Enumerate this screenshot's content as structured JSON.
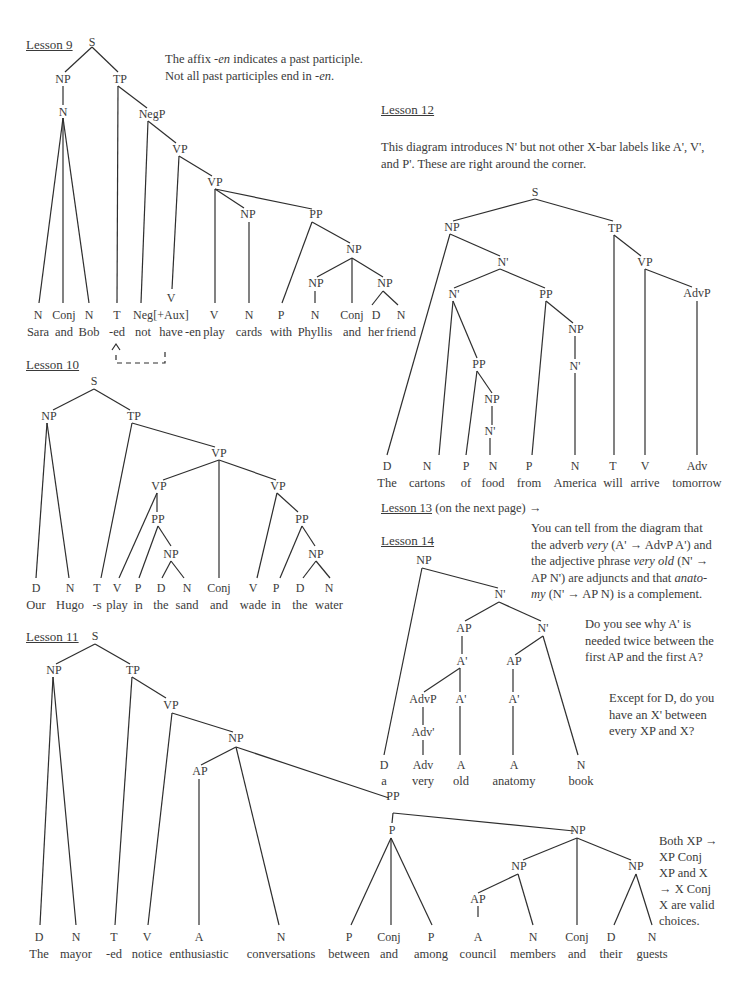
{
  "lesson9": {
    "title": "Lesson 9",
    "note_line1_pre": "The affix ",
    "note_line1_em": "-en",
    "note_line1_post": " indicates a past participle.",
    "note_line2_pre": "Not all past participles end in ",
    "note_line2_em": "-en",
    "note_line2_post": ".",
    "nodes": [
      {
        "id": "S",
        "label": "S",
        "x": 92,
        "y": 46
      },
      {
        "id": "NP1",
        "label": "NP",
        "x": 63,
        "y": 83
      },
      {
        "id": "TP",
        "label": "TP",
        "x": 120,
        "y": 83
      },
      {
        "id": "N1",
        "label": "N",
        "x": 63,
        "y": 116
      },
      {
        "id": "NegP",
        "label": "NegP",
        "x": 152,
        "y": 118
      },
      {
        "id": "VP1",
        "label": "VP",
        "x": 180,
        "y": 153
      },
      {
        "id": "VP2",
        "label": "VP",
        "x": 215,
        "y": 186
      },
      {
        "id": "NP2",
        "label": "NP",
        "x": 248,
        "y": 218
      },
      {
        "id": "PP",
        "label": "PP",
        "x": 316,
        "y": 218
      },
      {
        "id": "NP3",
        "label": "NP",
        "x": 354,
        "y": 253
      },
      {
        "id": "NP4",
        "label": "NP",
        "x": 316,
        "y": 287
      },
      {
        "id": "NP5",
        "label": "NP",
        "x": 385,
        "y": 287
      },
      {
        "id": "Vaux",
        "label": "V",
        "x": 171,
        "y": 302
      }
    ],
    "leaves": [
      {
        "pos": "N",
        "word": "Sara",
        "x": 38
      },
      {
        "pos": "Conj",
        "word": "and",
        "x": 64
      },
      {
        "pos": "N",
        "word": "Bob",
        "x": 89
      },
      {
        "pos": "T",
        "word": "-ed",
        "x": 117
      },
      {
        "pos": "Neg",
        "word": "not",
        "x": 143
      },
      {
        "pos": "[+Aux]",
        "word": "have",
        "x": 171
      },
      {
        "pos": "",
        "word": "-en",
        "x": 193
      },
      {
        "pos": "V",
        "word": "play",
        "x": 214
      },
      {
        "pos": "N",
        "word": "cards",
        "x": 249
      },
      {
        "pos": "P",
        "word": "with",
        "x": 281
      },
      {
        "pos": "N",
        "word": "Phyllis",
        "x": 315
      },
      {
        "pos": "Conj",
        "word": "and",
        "x": 352
      },
      {
        "pos": "D",
        "word": "her",
        "x": 376
      },
      {
        "pos": "N",
        "word": "friend",
        "x": 401
      }
    ]
  },
  "lesson10": {
    "title": "Lesson 10",
    "nodes": [
      {
        "label": "S",
        "x": 94,
        "y": 385
      },
      {
        "label": "NP",
        "x": 49,
        "y": 420
      },
      {
        "label": "TP",
        "x": 134,
        "y": 420
      },
      {
        "label": "VP",
        "x": 219,
        "y": 457
      },
      {
        "label": "VP",
        "x": 159,
        "y": 490
      },
      {
        "label": "VP",
        "x": 278,
        "y": 490
      },
      {
        "label": "PP",
        "x": 158,
        "y": 523
      },
      {
        "label": "PP",
        "x": 302,
        "y": 523
      },
      {
        "label": "NP",
        "x": 171,
        "y": 558
      },
      {
        "label": "NP",
        "x": 316,
        "y": 558
      }
    ],
    "leaves": [
      {
        "pos": "D",
        "word": "Our",
        "x": 36
      },
      {
        "pos": "N",
        "word": "Hugo",
        "x": 70
      },
      {
        "pos": "T",
        "word": "-s",
        "x": 97
      },
      {
        "pos": "V",
        "word": "play",
        "x": 117
      },
      {
        "pos": "P",
        "word": "in",
        "x": 138
      },
      {
        "pos": "D",
        "word": "the",
        "x": 161
      },
      {
        "pos": "N",
        "word": "sand",
        "x": 187
      },
      {
        "pos": "Conj",
        "word": "and",
        "x": 219
      },
      {
        "pos": "V",
        "word": "wade",
        "x": 253
      },
      {
        "pos": "P",
        "word": "in",
        "x": 276
      },
      {
        "pos": "D",
        "word": "the",
        "x": 300
      },
      {
        "pos": "N",
        "word": "water",
        "x": 329
      }
    ]
  },
  "lesson11": {
    "title": "Lesson 11",
    "note": [
      "Both XP →",
      "XP Conj",
      "XP and X",
      "→ X Conj",
      "X are valid",
      "choices."
    ],
    "nodes": [
      {
        "label": "S",
        "x": 95,
        "y": 640
      },
      {
        "label": "NP",
        "x": 54,
        "y": 674
      },
      {
        "label": "TP",
        "x": 133,
        "y": 674
      },
      {
        "label": "VP",
        "x": 171,
        "y": 709
      },
      {
        "label": "NP",
        "x": 236,
        "y": 742
      },
      {
        "label": "AP",
        "x": 200,
        "y": 775
      },
      {
        "label": "PP",
        "x": 393,
        "y": 800
      },
      {
        "label": "P",
        "x": 392,
        "y": 834
      },
      {
        "label": "NP",
        "x": 578,
        "y": 834
      },
      {
        "label": "NP",
        "x": 519,
        "y": 870
      },
      {
        "label": "NP",
        "x": 636,
        "y": 870
      },
      {
        "label": "AP",
        "x": 478,
        "y": 903
      }
    ],
    "leaves": [
      {
        "pos": "D",
        "word": "The",
        "x": 39
      },
      {
        "pos": "N",
        "word": "mayor",
        "x": 76
      },
      {
        "pos": "T",
        "word": "-ed",
        "x": 114
      },
      {
        "pos": "V",
        "word": "notice",
        "x": 147
      },
      {
        "pos": "A",
        "word": "enthusiastic",
        "x": 199
      },
      {
        "pos": "N",
        "word": "conversations",
        "x": 281
      },
      {
        "pos": "P",
        "word": "between",
        "x": 349
      },
      {
        "pos": "Conj",
        "word": "and",
        "x": 389
      },
      {
        "pos": "P",
        "word": "among",
        "x": 431
      },
      {
        "pos": "A",
        "word": "council",
        "x": 478
      },
      {
        "pos": "N",
        "word": "members",
        "x": 533
      },
      {
        "pos": "Conj",
        "word": "and",
        "x": 577
      },
      {
        "pos": "D",
        "word": "their",
        "x": 611
      },
      {
        "pos": "N",
        "word": "guests",
        "x": 652
      }
    ]
  },
  "lesson12": {
    "title": "Lesson 12",
    "note_line1": "This diagram introduces N' but not other X-bar labels like A', V',",
    "note_line2": "and P'. These are right around the corner.",
    "nodes": [
      {
        "label": "S",
        "x": 535,
        "y": 196
      },
      {
        "label": "NP",
        "x": 452,
        "y": 231
      },
      {
        "label": "TP",
        "x": 615,
        "y": 232
      },
      {
        "label": "N'",
        "x": 503,
        "y": 266
      },
      {
        "label": "VP",
        "x": 645,
        "y": 266
      },
      {
        "label": "N'",
        "x": 454,
        "y": 298
      },
      {
        "label": "PP",
        "x": 546,
        "y": 298
      },
      {
        "label": "AdvP",
        "x": 697,
        "y": 297
      },
      {
        "label": "NP",
        "x": 576,
        "y": 333
      },
      {
        "label": "PP",
        "x": 479,
        "y": 368
      },
      {
        "label": "N'",
        "x": 575,
        "y": 370
      },
      {
        "label": "NP",
        "x": 492,
        "y": 403
      },
      {
        "label": "N'",
        "x": 490,
        "y": 435
      }
    ],
    "leaves": [
      {
        "pos": "D",
        "word": "The",
        "x": 387
      },
      {
        "pos": "N",
        "word": "cartons",
        "x": 427
      },
      {
        "pos": "P",
        "word": "of",
        "x": 466
      },
      {
        "pos": "N",
        "word": "food",
        "x": 493
      },
      {
        "pos": "P",
        "word": "from",
        "x": 529
      },
      {
        "pos": "N",
        "word": "America",
        "x": 575
      },
      {
        "pos": "T",
        "word": "will",
        "x": 613
      },
      {
        "pos": "V",
        "word": "arrive",
        "x": 645
      },
      {
        "pos": "Adv",
        "word": "tomorrow",
        "x": 697
      }
    ]
  },
  "lesson13": {
    "title": "Lesson 13",
    "suffix": " (on the next page) →"
  },
  "lesson14": {
    "title": "Lesson 14",
    "note1": {
      "l1": "You can tell from the diagram that",
      "l2_pre": "the adverb ",
      "l2_em": "very",
      "l2_post": " (A' → AdvP A') and",
      "l3_pre": "the adjective phrase ",
      "l3_em": "very old",
      "l3_post": " (N' →",
      "l4_pre": "AP N') are adjuncts and that ",
      "l4_em": "anato-",
      "l5_em": "my",
      "l5_post": " (N' → AP N) is a complement."
    },
    "note2": [
      "Do you see why A' is",
      "needed twice between the",
      "first AP and the first A?"
    ],
    "note3": [
      "Except for D, do you",
      "have an X' between",
      "every XP and X?"
    ],
    "nodes": [
      {
        "label": "NP",
        "x": 424,
        "y": 564
      },
      {
        "label": "N'",
        "x": 500,
        "y": 598
      },
      {
        "label": "AP",
        "x": 464,
        "y": 632
      },
      {
        "label": "N'",
        "x": 543,
        "y": 632
      },
      {
        "label": "A'",
        "x": 462,
        "y": 665
      },
      {
        "label": "AP",
        "x": 514,
        "y": 665
      },
      {
        "label": "AdvP",
        "x": 423,
        "y": 703
      },
      {
        "label": "A'",
        "x": 461,
        "y": 703
      },
      {
        "label": "A'",
        "x": 514,
        "y": 703
      },
      {
        "label": "Adv'",
        "x": 423,
        "y": 736
      }
    ],
    "leaves": [
      {
        "pos": "D",
        "word": "a",
        "x": 384
      },
      {
        "pos": "Adv",
        "word": "very",
        "x": 423
      },
      {
        "pos": "A",
        "word": "old",
        "x": 461
      },
      {
        "pos": "A",
        "word": "anatomy",
        "x": 514
      },
      {
        "pos": "N",
        "word": "book",
        "x": 581
      }
    ]
  }
}
